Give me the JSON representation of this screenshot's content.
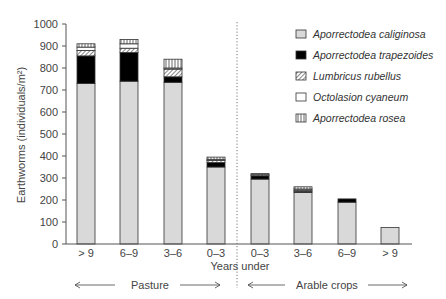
{
  "chart_data": {
    "type": "bar",
    "stacked": true,
    "title": "",
    "xlabel": "Years under",
    "ylabel": "Earthworms (individuals/m²)",
    "ylim": [
      0,
      1000
    ],
    "yticks": [
      0,
      100,
      200,
      300,
      400,
      500,
      600,
      700,
      800,
      900,
      1000
    ],
    "categories": [
      "> 9",
      "6–9",
      "3–6",
      "0–3",
      "0–3",
      "3–6",
      "6–9",
      "> 9"
    ],
    "groups": [
      {
        "label": "Pasture",
        "categories": [
          "> 9",
          "6–9",
          "3–6",
          "0–3"
        ]
      },
      {
        "label": "Arable crops",
        "categories": [
          "0–3",
          "3–6",
          "6–9",
          "> 9"
        ]
      }
    ],
    "series": [
      {
        "name": "Aporrectodea caliginosa",
        "pattern": "light-gray",
        "values": [
          730,
          740,
          735,
          350,
          295,
          235,
          190,
          75
        ]
      },
      {
        "name": "Aporrectodea trapezoides",
        "pattern": "black",
        "values": [
          125,
          130,
          25,
          20,
          15,
          5,
          15,
          0
        ]
      },
      {
        "name": "Lumbricus rubellus",
        "pattern": "diagonal-hatch",
        "values": [
          25,
          20,
          35,
          10,
          5,
          5,
          0,
          0
        ]
      },
      {
        "name": "Octolasion cyaneum",
        "pattern": "white",
        "values": [
          15,
          20,
          5,
          5,
          0,
          5,
          0,
          0
        ]
      },
      {
        "name": "Aporrectodea rosea",
        "pattern": "vertical-lines",
        "values": [
          15,
          20,
          40,
          10,
          5,
          10,
          0,
          0
        ]
      }
    ],
    "legend_position": "top-right",
    "grid": false,
    "divider": "dotted vertical line between Pasture and Arable crops"
  },
  "colors": {
    "caliginosa": "#d9d9d9",
    "trapezoides": "#000000",
    "axis": "#555555",
    "bar_outline": "#333333"
  },
  "group_labels": {
    "pasture": "Pasture",
    "arable": "Arable crops"
  },
  "arrows": {
    "left": "←",
    "right": "→"
  }
}
